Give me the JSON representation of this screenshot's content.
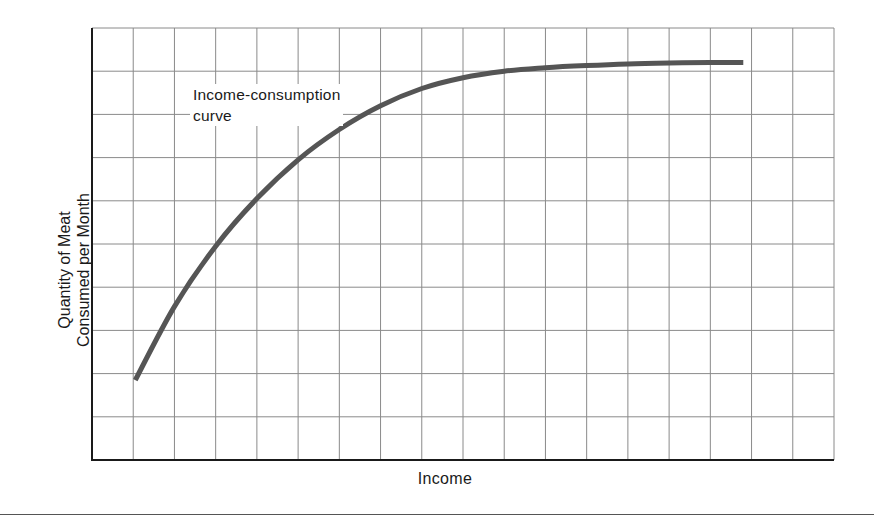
{
  "chart_data": {
    "type": "line",
    "title": "",
    "xlabel": "Income",
    "ylabel": "Quantity of Meat Consumed per Month",
    "ylabel_lines": [
      "Quantity of Meat",
      "Consumed per Month"
    ],
    "grid": true,
    "grid_columns": 18,
    "grid_rows": 10,
    "xlim": [
      0,
      18
    ],
    "ylim": [
      0,
      10
    ],
    "tick_labels": {
      "x": [],
      "y": []
    },
    "legend": null,
    "annotations": [
      {
        "text": "Income-consumption curve",
        "lines": [
          "Income-consumption",
          "curve"
        ],
        "x": 2.4,
        "y": 8.4
      }
    ],
    "series": [
      {
        "name": "Income-consumption curve",
        "color": "#555555",
        "x": [
          1.05,
          2.0,
          3.0,
          4.0,
          5.0,
          6.0,
          7.0,
          8.0,
          9.0,
          10.0,
          11.0,
          12.0,
          13.0,
          14.0,
          15.0,
          15.8
        ],
        "y": [
          1.85,
          3.55,
          4.95,
          6.05,
          6.95,
          7.65,
          8.2,
          8.6,
          8.85,
          9.0,
          9.08,
          9.13,
          9.17,
          9.19,
          9.2,
          9.2
        ]
      }
    ]
  },
  "figure": {
    "x_axis_label": "Income",
    "y_axis_label_line1": "Quantity of Meat",
    "y_axis_label_line2": "Consumed per Month",
    "annotation_line1": "Income-consumption",
    "annotation_line2": "curve"
  },
  "colors": {
    "axis": "#1a1a1a",
    "grid": "#8a8a8a",
    "curve": "#555555",
    "background": "#ffffff"
  }
}
